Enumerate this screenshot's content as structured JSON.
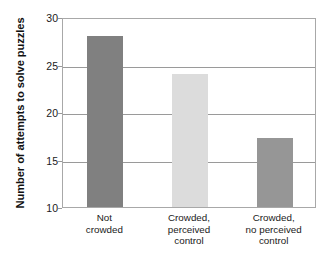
{
  "chart_data": {
    "type": "bar",
    "title": "",
    "xlabel": "",
    "ylabel": "Number of attempts to solve puzzles",
    "categories": [
      "Not\ncrowded",
      "Crowded,\nperceived\ncontrol",
      "Crowded,\nno perceived\ncontrol"
    ],
    "category_lines": [
      [
        "Not",
        "crowded"
      ],
      [
        "Crowded,",
        "perceived",
        "control"
      ],
      [
        "Crowded,",
        "no perceived",
        "control"
      ]
    ],
    "values": [
      28,
      24,
      17.3
    ],
    "bar_colors": [
      "#808080",
      "#dcdcdc",
      "#969696"
    ],
    "ylim": [
      10,
      30
    ],
    "yticks": [
      10,
      15,
      20,
      25,
      30
    ],
    "ytick_labels": [
      "10",
      "15",
      "20",
      "25",
      "30"
    ],
    "grid": true,
    "grid_axis": "y",
    "legend": false,
    "legend_position": "none"
  },
  "style": {
    "frame_color": "#a8a8a8",
    "grid_color": "#9a9a9a",
    "text_color": "#1a1a1a",
    "background": "#ffffff"
  }
}
